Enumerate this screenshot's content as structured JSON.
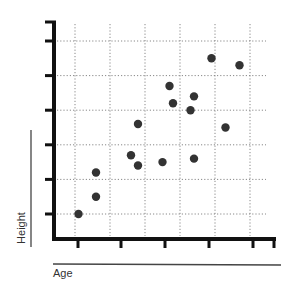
{
  "chart_data": {
    "type": "scatter",
    "title": "",
    "xlabel": "Age",
    "ylabel": "Height",
    "x_ticks": [
      1,
      2,
      3,
      4,
      5,
      6
    ],
    "y_ticks": [
      1,
      2,
      3,
      4,
      5,
      6
    ],
    "tick_labels_shown": false,
    "xlim": [
      0.1,
      6.7
    ],
    "ylim": [
      0.3,
      6.6
    ],
    "grid": true,
    "grid_style": "dotted",
    "legend": null,
    "series": [
      {
        "name": "points",
        "color": "#333333",
        "x": [
          1.1,
          1.6,
          1.6,
          2.6,
          2.8,
          2.8,
          3.5,
          3.7,
          3.8,
          4.3,
          4.4,
          4.4,
          4.9,
          5.3,
          5.7
        ],
        "y": [
          1.0,
          1.5,
          2.2,
          2.7,
          2.4,
          3.6,
          2.5,
          4.7,
          4.2,
          4.0,
          4.4,
          2.6,
          5.5,
          3.5,
          5.3
        ]
      }
    ]
  },
  "labels": {
    "x": "Age",
    "y": "Height"
  }
}
